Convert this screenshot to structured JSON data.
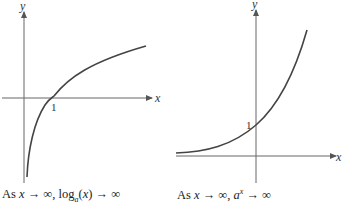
{
  "left_graph": {
    "function": "log_a(x)",
    "x_axis_label": "x",
    "y_axis_label": "y",
    "tick_label": "1",
    "caption": {
      "prefix": "As ",
      "var": "x",
      "middle": " → ∞, log",
      "sub": "a",
      "arg_open": "(",
      "arg": "x",
      "suffix": ") → ∞"
    }
  },
  "right_graph": {
    "function": "a^x",
    "x_axis_label": "x",
    "y_axis_label": "y",
    "tick_label": "1",
    "caption": {
      "prefix": "As ",
      "var": "x",
      "middle": " → ∞, ",
      "base": "a",
      "exp": "x",
      "suffix": " → ∞"
    }
  },
  "colors": {
    "axis": "#555555",
    "curve": "#444444",
    "text": "#222222"
  }
}
